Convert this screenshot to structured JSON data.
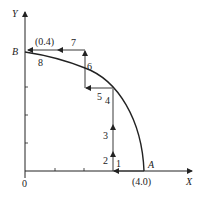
{
  "diagram": {
    "axes": {
      "x_label": "X",
      "y_label": "Y",
      "origin_label": "0"
    },
    "points": {
      "A": {
        "label": "A",
        "coord": "(4.0)"
      },
      "B": {
        "label": "B",
        "coord": "(0.4)"
      }
    },
    "step_labels": [
      "1",
      "2",
      "3",
      "4",
      "5",
      "6",
      "7",
      "8"
    ],
    "colors": {
      "line": "#222222",
      "caption": "#c8c8c8"
    }
  },
  "caption": ""
}
